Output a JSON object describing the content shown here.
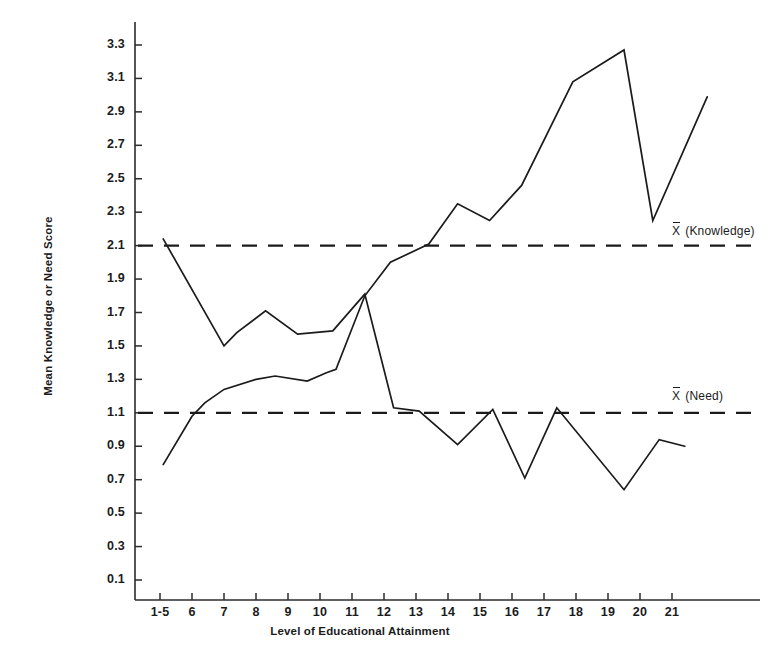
{
  "figure": {
    "axis_titles": {
      "y": "Mean Knowledge or Need Score",
      "x": "Level of Educational Attainment"
    },
    "annotations": {
      "knowledge_mean_symbol": "X",
      "knowledge_mean_text": "(Knowledge)",
      "need_mean_symbol": "X",
      "need_mean_text": "(Need)"
    },
    "colors": {
      "line": "#1b1b1b",
      "axis": "#2b2b2b",
      "background": "#ffffff"
    }
  },
  "chart_data": {
    "type": "line",
    "title": "",
    "xlabel": "Level of Educational Attainment",
    "ylabel": "Mean Knowledge or Need Score",
    "ylim": [
      0.0,
      3.45
    ],
    "xlim": [
      0.2,
      22.6
    ],
    "grid": false,
    "legend_position": "right-inline",
    "y_ticks": [
      "0.1",
      "0.3",
      "0.5",
      "0.7",
      "0.9",
      "1.1",
      "1.3",
      "1.5",
      "1.7",
      "1.9",
      "2.1",
      "2.3",
      "2.5",
      "2.7",
      "2.9",
      "3.1",
      "3.3"
    ],
    "y_tick_values": [
      0.1,
      0.3,
      0.5,
      0.7,
      0.9,
      1.1,
      1.3,
      1.5,
      1.7,
      1.9,
      2.1,
      2.3,
      2.5,
      2.7,
      2.9,
      3.1,
      3.3
    ],
    "x_ticks": [
      "1-5",
      "6",
      "7",
      "8",
      "9",
      "10",
      "11",
      "12",
      "13",
      "14",
      "15",
      "16",
      "17",
      "18",
      "19",
      "20",
      "21"
    ],
    "x_tick_values": [
      5,
      6,
      7,
      8,
      9,
      10,
      11,
      12,
      13,
      14,
      15,
      16,
      17,
      18,
      19,
      20,
      21
    ],
    "reference_lines": [
      {
        "name": "X-bar (Knowledge)",
        "value": 2.1,
        "style": "dashed"
      },
      {
        "name": "X-bar (Need)",
        "value": 1.1,
        "style": "dashed"
      }
    ],
    "series": [
      {
        "name": "Knowledge",
        "style": "solid",
        "points": [
          {
            "x": 5.1,
            "y": 0.79
          },
          {
            "x": 6.0,
            "y": 1.08
          },
          {
            "x": 6.4,
            "y": 1.16
          },
          {
            "x": 7.0,
            "y": 1.24
          },
          {
            "x": 8.0,
            "y": 1.3
          },
          {
            "x": 8.6,
            "y": 1.32
          },
          {
            "x": 9.6,
            "y": 1.29
          },
          {
            "x": 10.2,
            "y": 1.34
          },
          {
            "x": 10.5,
            "y": 1.36
          },
          {
            "x": 11.4,
            "y": 1.8
          },
          {
            "x": 12.2,
            "y": 2.0
          },
          {
            "x": 13.4,
            "y": 2.11
          },
          {
            "x": 14.3,
            "y": 2.35
          },
          {
            "x": 15.3,
            "y": 2.25
          },
          {
            "x": 16.3,
            "y": 2.46
          },
          {
            "x": 17.9,
            "y": 3.08
          },
          {
            "x": 19.5,
            "y": 3.27
          },
          {
            "x": 20.4,
            "y": 2.25
          },
          {
            "x": 22.1,
            "y": 2.99
          }
        ]
      },
      {
        "name": "Need",
        "style": "solid",
        "points": [
          {
            "x": 5.1,
            "y": 2.14
          },
          {
            "x": 7.0,
            "y": 1.5
          },
          {
            "x": 7.4,
            "y": 1.58
          },
          {
            "x": 8.3,
            "y": 1.71
          },
          {
            "x": 9.3,
            "y": 1.57
          },
          {
            "x": 10.4,
            "y": 1.59
          },
          {
            "x": 11.4,
            "y": 1.81
          },
          {
            "x": 12.3,
            "y": 1.13
          },
          {
            "x": 13.1,
            "y": 1.11
          },
          {
            "x": 14.3,
            "y": 0.91
          },
          {
            "x": 15.4,
            "y": 1.12
          },
          {
            "x": 16.4,
            "y": 0.71
          },
          {
            "x": 17.4,
            "y": 1.13
          },
          {
            "x": 19.5,
            "y": 0.64
          },
          {
            "x": 20.6,
            "y": 0.94
          },
          {
            "x": 21.4,
            "y": 0.9
          }
        ]
      }
    ]
  }
}
